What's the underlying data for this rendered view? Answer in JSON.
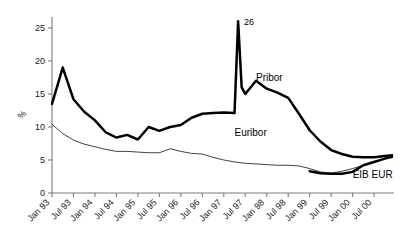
{
  "chart_data": {
    "type": "line",
    "title": "",
    "subtitle": "",
    "xlabel": "",
    "ylabel": "%",
    "ylim": [
      0,
      26.5
    ],
    "yticks": [
      0,
      5,
      10,
      15,
      20,
      25
    ],
    "ytick_labels": [
      "0",
      "5",
      "10",
      "15",
      "20",
      "25"
    ],
    "grid": false,
    "legend_position": "inline-annotations",
    "xtick_labels": [
      "Jan 93",
      "Jul 93",
      "Jan 94",
      "Jul 94",
      "Jan 95",
      "Jul 95",
      "Jan 96",
      "Jul 96",
      "Jan 97",
      "Jul 97",
      "Jan 98",
      "Jul 98",
      "Jan 99",
      "Jul 99",
      "Jan 00",
      "Jul 00"
    ],
    "x_start": "Jan 93",
    "x_end": "Dec 00",
    "x_step_months": 6,
    "annotations": [
      {
        "text": "26",
        "series": "Pribor",
        "x": "May 97",
        "y": 26
      }
    ],
    "series": [
      {
        "name": "Pribor",
        "style": "thick",
        "color": "#000000",
        "label_x": "Oct 97",
        "label_y": 17.0,
        "x": [
          "Jan 93",
          "Apr 93",
          "Jul 93",
          "Oct 93",
          "Jan 94",
          "Apr 94",
          "Jul 94",
          "Oct 94",
          "Jan 95",
          "Apr 95",
          "Jul 95",
          "Oct 95",
          "Jan 96",
          "Apr 96",
          "Jul 96",
          "Oct 96",
          "Jan 97",
          "Apr 97",
          "May 97",
          "Jun 97",
          "Jul 97",
          "Oct 97",
          "Jan 98",
          "Apr 98",
          "Jul 98",
          "Oct 98",
          "Jan 99",
          "Apr 99",
          "Jul 99",
          "Oct 99",
          "Jan 00",
          "Apr 00",
          "Jul 00",
          "Oct 00",
          "Dec 00"
        ],
        "values": [
          13.5,
          19.0,
          14.2,
          12.3,
          11.0,
          9.2,
          8.4,
          8.8,
          8.1,
          10.0,
          9.4,
          10.0,
          10.3,
          11.4,
          12.0,
          12.1,
          12.2,
          12.1,
          26.0,
          16.0,
          15.0,
          17.0,
          15.8,
          15.2,
          14.4,
          12.0,
          9.5,
          7.8,
          6.5,
          5.9,
          5.5,
          5.4,
          5.4,
          5.6,
          5.7
        ]
      },
      {
        "name": "Euribor",
        "style": "thin",
        "color": "#2b2b2b",
        "label_x": "Apr 97",
        "label_y": 8.6,
        "x": [
          "Jan 93",
          "Apr 93",
          "Jul 93",
          "Oct 93",
          "Jan 94",
          "Apr 94",
          "Jul 94",
          "Oct 94",
          "Jan 95",
          "Apr 95",
          "Jul 95",
          "Oct 95",
          "Jan 96",
          "Apr 96",
          "Jul 96",
          "Oct 96",
          "Jan 97",
          "Apr 97",
          "Jul 97",
          "Oct 97",
          "Jan 98",
          "Apr 98",
          "Jul 98",
          "Oct 98",
          "Jan 99",
          "Apr 99",
          "Jul 99",
          "Oct 99",
          "Jan 00",
          "Apr 00",
          "Jul 00",
          "Oct 00",
          "Dec 00"
        ],
        "values": [
          10.4,
          9.0,
          8.0,
          7.4,
          7.0,
          6.6,
          6.3,
          6.3,
          6.2,
          6.1,
          6.1,
          6.7,
          6.3,
          6.0,
          5.9,
          5.4,
          5.0,
          4.7,
          4.5,
          4.4,
          4.3,
          4.2,
          4.2,
          4.1,
          3.7,
          3.2,
          3.0,
          3.3,
          3.7,
          4.2,
          4.8,
          5.2,
          5.4
        ]
      },
      {
        "name": "EIB EUR",
        "style": "thick",
        "color": "#000000",
        "label_x": "Jan 00",
        "label_y": 2.2,
        "x": [
          "Jan 99",
          "Apr 99",
          "Jul 99",
          "Oct 99",
          "Jan 00",
          "Apr 00",
          "Jul 00",
          "Oct 00",
          "Dec 00"
        ],
        "values": [
          3.3,
          3.0,
          2.9,
          2.9,
          3.2,
          4.2,
          4.7,
          5.2,
          5.5
        ]
      }
    ]
  }
}
